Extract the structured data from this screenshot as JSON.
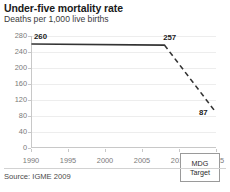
{
  "chart_data": {
    "type": "line",
    "title": "Under-five mortality rate",
    "subtitle": "Deaths per 1,000 live births",
    "xlabel": "",
    "ylabel": "",
    "xlim": [
      1990,
      2015
    ],
    "ylim": [
      0,
      280
    ],
    "grid": true,
    "legend_position": "inside-bottom-right",
    "x_ticks": [
      "1990",
      "1995",
      "2000",
      "2005",
      "2010",
      "2015"
    ],
    "x_tick_values": [
      1990,
      1995,
      2000,
      2005,
      2010,
      2015
    ],
    "y_ticks": [
      "280",
      "240",
      "200",
      "160",
      "120",
      "80",
      "40",
      "0"
    ],
    "y_tick_values": [
      280,
      240,
      200,
      160,
      120,
      80,
      40,
      0
    ],
    "series": [
      {
        "name": "Observed under-five mortality rate",
        "style": "solid",
        "color": "#333333",
        "x": [
          1990,
          2008
        ],
        "values": [
          260,
          257
        ]
      },
      {
        "name": "Projected path to MDG target",
        "style": "dashed",
        "color": "#333333",
        "x": [
          2008,
          2015
        ],
        "values": [
          257,
          87
        ]
      }
    ],
    "point_labels": [
      {
        "text": "260",
        "x": 1990,
        "value": 260
      },
      {
        "text": "257",
        "x": 2008,
        "value": 257
      },
      {
        "text": "87",
        "x": 2015,
        "value": 87
      }
    ],
    "annotations": [
      {
        "name": "mdg-target",
        "line1": "MDG",
        "line2": "Target"
      }
    ],
    "source": "Source:  IGME 2009"
  }
}
